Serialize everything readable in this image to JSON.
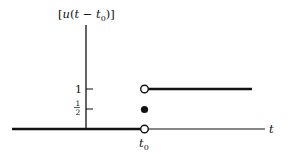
{
  "diagram": {
    "y_axis_label": {
      "open": "[",
      "func": "u",
      "paren_open": "(",
      "var": "t",
      "minus": " − ",
      "shift": "t",
      "shift_sub": "0",
      "paren_close": ")]"
    },
    "x_axis_label": "t",
    "ticks": {
      "one": "1",
      "half_num": "1",
      "half_den": "2"
    },
    "t0_label": {
      "base": "t",
      "sub": "0"
    },
    "points": [
      {
        "name": "open-circle-at-1",
        "x": "t0",
        "y": 1,
        "style": "open"
      },
      {
        "name": "filled-dot-at-half",
        "x": "t0",
        "y": 0.5,
        "style": "filled"
      },
      {
        "name": "open-circle-at-0",
        "x": "t0",
        "y": 0,
        "style": "open"
      }
    ],
    "colors": {
      "ink": "#111111",
      "background": "#ffffff"
    }
  }
}
